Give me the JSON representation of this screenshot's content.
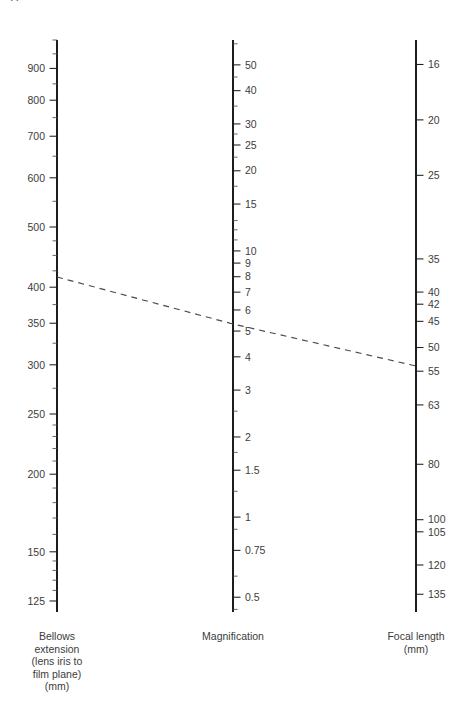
{
  "page_header": {
    "folio": "44",
    "running_head": "CLOSE-UP AND MACRO PHOTOGRAPHY"
  },
  "chart_data": {
    "type": "line",
    "subtype": "nomogram",
    "grid": false,
    "legend": "none",
    "axes": [
      {
        "id": "bellows-extension",
        "name": "Bellows extension",
        "caption_lines": [
          "Bellows",
          "extension",
          "(lens iris to",
          "film plane)",
          "(mm)"
        ],
        "unit": "mm",
        "scale": "log",
        "position_x": 57,
        "y_top": 40,
        "y_bottom": 612,
        "domain": [
          120,
          1000
        ],
        "label_side": "left",
        "major_ticks": [
          {
            "value": 900,
            "label": "900"
          },
          {
            "value": 800,
            "label": "800"
          },
          {
            "value": 700,
            "label": "700"
          },
          {
            "value": 600,
            "label": "600"
          },
          {
            "value": 500,
            "label": "500"
          },
          {
            "value": 400,
            "label": "400"
          },
          {
            "value": 350,
            "label": "350"
          },
          {
            "value": 300,
            "label": "300"
          },
          {
            "value": 250,
            "label": "250"
          },
          {
            "value": 200,
            "label": "200"
          },
          {
            "value": 150,
            "label": "150"
          },
          {
            "value": 125,
            "label": "125"
          }
        ],
        "minor_ticks": [
          1000,
          950,
          850,
          750,
          650,
          550,
          475,
          450,
          425,
          375,
          325,
          275,
          240,
          230,
          220,
          210,
          190,
          180,
          170,
          160,
          145,
          140,
          135,
          130
        ]
      },
      {
        "id": "magnification",
        "name": "Magnification",
        "caption_lines": [
          "Magnification"
        ],
        "unit": "",
        "scale": "log",
        "position_x": 233,
        "y_top": 40,
        "y_bottom": 612,
        "domain": [
          0.44,
          62
        ],
        "label_side": "right",
        "major_ticks": [
          {
            "value": 50,
            "label": "50"
          },
          {
            "value": 40,
            "label": "40"
          },
          {
            "value": 30,
            "label": "30"
          },
          {
            "value": 25,
            "label": "25"
          },
          {
            "value": 20,
            "label": "20"
          },
          {
            "value": 15,
            "label": "15"
          },
          {
            "value": 10,
            "label": "10"
          },
          {
            "value": 9,
            "label": "9"
          },
          {
            "value": 8,
            "label": "8"
          },
          {
            "value": 7,
            "label": "7"
          },
          {
            "value": 6,
            "label": "6"
          },
          {
            "value": 5,
            "label": "5"
          },
          {
            "value": 4,
            "label": "4"
          },
          {
            "value": 3,
            "label": "3"
          },
          {
            "value": 2,
            "label": "2"
          },
          {
            "value": 1.5,
            "label": "1.5"
          },
          {
            "value": 1,
            "label": "1"
          },
          {
            "value": 0.75,
            "label": "0.75"
          },
          {
            "value": 0.5,
            "label": "0.5"
          }
        ],
        "minor_ticks": [
          60,
          45,
          35,
          27.5,
          22.5,
          17.5,
          13,
          12,
          11,
          2.5,
          1.75,
          1.25,
          0.9,
          0.6,
          0.45
        ]
      },
      {
        "id": "focal-length",
        "name": "Focal length",
        "caption_lines": [
          "Focal length",
          "(mm)"
        ],
        "unit": "mm",
        "scale": "log-inverted",
        "position_x": 416,
        "y_top": 40,
        "y_bottom": 612,
        "domain": [
          14.5,
          145
        ],
        "label_side": "right",
        "major_ticks": [
          {
            "value": 16,
            "label": "16"
          },
          {
            "value": 20,
            "label": "20"
          },
          {
            "value": 25,
            "label": "25"
          },
          {
            "value": 35,
            "label": "35"
          },
          {
            "value": 40,
            "label": "40"
          },
          {
            "value": 42,
            "label": "42"
          },
          {
            "value": 45,
            "label": "45"
          },
          {
            "value": 50,
            "label": "50"
          },
          {
            "value": 55,
            "label": "55"
          },
          {
            "value": 63,
            "label": "63"
          },
          {
            "value": 80,
            "label": "80"
          },
          {
            "value": 100,
            "label": "100"
          },
          {
            "value": 105,
            "label": "105"
          },
          {
            "value": 120,
            "label": "120"
          },
          {
            "value": 135,
            "label": "135"
          }
        ],
        "minor_ticks": []
      }
    ],
    "index_line": {
      "name": "worked-example-index-line",
      "style": "dashed",
      "readings": [
        {
          "axis": "bellows-extension",
          "value": 400,
          "x": 57,
          "y": 277
        },
        {
          "axis": "magnification",
          "value": 7,
          "x": 233,
          "y": 324
        },
        {
          "axis": "focal-length",
          "value": 50,
          "x": 416,
          "y": 366
        }
      ]
    }
  },
  "colors": {
    "axis": "#1d1d1d",
    "text": "#3c3c3c",
    "index_line": "#4a4a4a",
    "background": "#ffffff"
  }
}
